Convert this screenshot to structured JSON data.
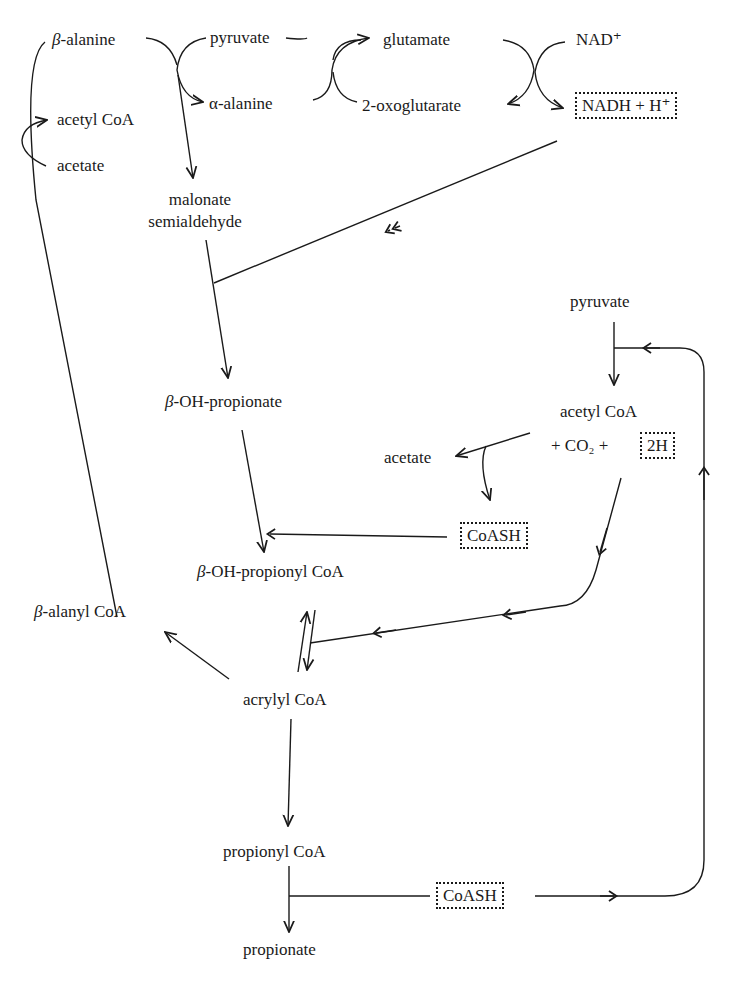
{
  "diagram": {
    "type": "metabolic-pathway",
    "nodes": {
      "beta_alanine": "β-alanine",
      "pyruvate_top": "pyruvate",
      "glutamate": "glutamate",
      "nad_plus": "NAD⁺",
      "alpha_alanine": "α-alanine",
      "oxoglutarate": "2-oxoglutarate",
      "nadh": "NADH + H⁺",
      "acetyl_coa_left": "acetyl CoA",
      "acetate_left": "acetate",
      "malonate_line1": "malonate",
      "malonate_line2": "semialdehyde",
      "pyruvate_right": "pyruvate",
      "beta_oh_propionate": "β-OH-propionate",
      "acetyl_coa_right": "acetyl CoA",
      "co2_line": "+ CO₂ +",
      "two_h": "2H",
      "acetate_right": "acetate",
      "coash_mid": "CoASH",
      "beta_oh_propionyl_coa": "β-OH-propionyl CoA",
      "beta_alanyl_coa": "β-alanyl CoA",
      "acrylyl_coa": "acrylyl CoA",
      "propionyl_coa": "propionyl CoA",
      "coash_bottom": "CoASH",
      "propionate": "propionate"
    },
    "boxed_nodes": [
      "NADH + H⁺",
      "2H",
      "CoASH",
      "CoASH"
    ],
    "edges": [
      {
        "from": "β-alanine",
        "to": "malonate semialdehyde",
        "coupled": "pyruvate → α-alanine"
      },
      {
        "from": "α-alanine",
        "to": "pyruvate",
        "coupled": "2-oxoglutarate → glutamate"
      },
      {
        "from": "glutamate",
        "to": "2-oxoglutarate",
        "coupled": "NAD⁺ → NADH + H⁺"
      },
      {
        "from": "NADH + H⁺",
        "to": "malonate semialdehyde → β-OH-propionate"
      },
      {
        "from": "malonate semialdehyde",
        "to": "β-OH-propionate"
      },
      {
        "from": "β-OH-propionate",
        "to": "β-OH-propionyl CoA",
        "cofactor": "CoASH"
      },
      {
        "from": "pyruvate",
        "to": "acetyl CoA + CO₂ + 2H"
      },
      {
        "from": "acetyl CoA",
        "to": "acetate",
        "releases": "CoASH"
      },
      {
        "from": "2H",
        "to": "β-OH-propionyl CoA ⇌ acrylyl CoA"
      },
      {
        "from": "β-OH-propionyl CoA",
        "to": "acrylyl CoA",
        "reversible": true
      },
      {
        "from": "acrylyl CoA",
        "to": "β-alanyl CoA"
      },
      {
        "from": "β-alanyl CoA",
        "to": "β-alanine",
        "coupled": "acetate → acetyl CoA"
      },
      {
        "from": "acrylyl CoA",
        "to": "propionyl CoA"
      },
      {
        "from": "propionyl CoA",
        "to": "propionate",
        "releases": "CoASH"
      },
      {
        "from": "CoASH",
        "to": "pyruvate → acetyl CoA"
      }
    ]
  }
}
